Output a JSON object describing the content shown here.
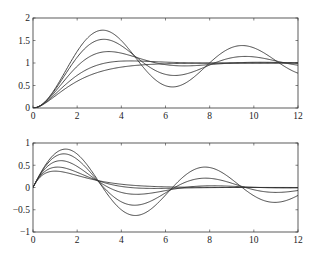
{
  "chart_data": [
    {
      "type": "line",
      "title": "",
      "xlabel": "",
      "ylabel": "",
      "xlim": [
        0,
        12
      ],
      "ylim": [
        0,
        2
      ],
      "xticks": [
        0,
        2,
        4,
        6,
        8,
        10,
        12
      ],
      "yticks": [
        0,
        0.5,
        1,
        1.5,
        2
      ],
      "xtick_labels": [
        "0",
        "2",
        "4",
        "6",
        "8",
        "10",
        "12"
      ],
      "ytick_labels": [
        "0",
        "0.5",
        "1",
        "1.5",
        "2"
      ],
      "grid": false,
      "description": "Step responses of second-order systems (wn=1) for several damping ratios",
      "series": [
        {
          "name": "zeta=0.1",
          "zeta": 0.1,
          "kind": "step",
          "peak": 1.73,
          "peak_t": 3.1
        },
        {
          "name": "zeta=0.2",
          "zeta": 0.2,
          "kind": "step",
          "peak": 1.52,
          "peak_t": 3.2
        },
        {
          "name": "zeta=0.4",
          "zeta": 0.4,
          "kind": "step",
          "peak": 1.25,
          "peak_t": 3.4
        },
        {
          "name": "zeta=0.7",
          "zeta": 0.7,
          "kind": "step",
          "peak": 1.05,
          "peak_t": 4.4
        },
        {
          "name": "zeta=1.0",
          "zeta": 1.0,
          "kind": "step",
          "peak": 1.0,
          "peak_t": 12
        }
      ]
    },
    {
      "type": "line",
      "title": "",
      "xlabel": "",
      "ylabel": "",
      "xlim": [
        0,
        12
      ],
      "ylim": [
        -1,
        1
      ],
      "xticks": [
        0,
        2,
        4,
        6,
        8,
        10,
        12
      ],
      "yticks": [
        -1,
        -0.5,
        0,
        0.5,
        1
      ],
      "xtick_labels": [
        "0",
        "2",
        "4",
        "6",
        "8",
        "10",
        "12"
      ],
      "ytick_labels": [
        "-1",
        "-0.5",
        "0",
        "0.5",
        "1"
      ],
      "grid": false,
      "description": "Impulse responses of second-order systems (wn=1) for several damping ratios",
      "series": [
        {
          "name": "zeta=0.1",
          "zeta": 0.1,
          "kind": "impulse",
          "peak": 0.85,
          "peak_t": 1.5
        },
        {
          "name": "zeta=0.2",
          "zeta": 0.2,
          "kind": "impulse",
          "peak": 0.72,
          "peak_t": 1.4
        },
        {
          "name": "zeta=0.4",
          "zeta": 0.4,
          "kind": "impulse",
          "peak": 0.6,
          "peak_t": 1.3
        },
        {
          "name": "zeta=0.7",
          "zeta": 0.7,
          "kind": "impulse",
          "peak": 0.47,
          "peak_t": 1.1
        },
        {
          "name": "zeta=1.0",
          "zeta": 1.0,
          "kind": "impulse",
          "peak": 0.37,
          "peak_t": 1.0
        }
      ]
    }
  ]
}
